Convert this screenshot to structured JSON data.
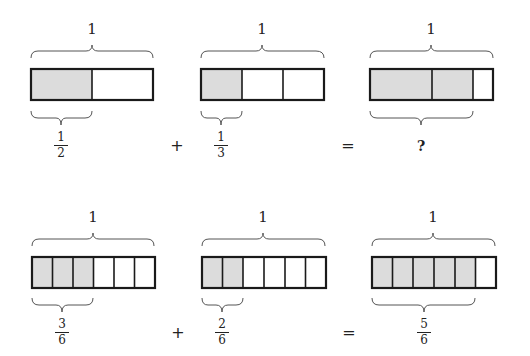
{
  "colors": {
    "fill": "#dcdcdc",
    "stroke": "#1a1a1a",
    "brace": "#555555"
  },
  "rows": [
    {
      "operator_plus": "+",
      "operator_equals": "=",
      "bars": [
        {
          "whole_label": "1",
          "parts": 2,
          "shaded": 1,
          "label": {
            "num": "1",
            "den": "2"
          }
        },
        {
          "whole_label": "1",
          "parts": 3,
          "shaded": 1,
          "label": {
            "num": "1",
            "den": "3"
          }
        },
        {
          "whole_label": "1",
          "parts": 6,
          "shaded": 5,
          "result_label": "?"
        }
      ]
    },
    {
      "operator_plus": "+",
      "operator_equals": "=",
      "bars": [
        {
          "whole_label": "1",
          "parts": 6,
          "shaded": 3,
          "label": {
            "num": "3",
            "den": "6"
          }
        },
        {
          "whole_label": "1",
          "parts": 6,
          "shaded": 2,
          "label": {
            "num": "2",
            "den": "6"
          }
        },
        {
          "whole_label": "1",
          "parts": 6,
          "shaded": 5,
          "label": {
            "num": "5",
            "den": "6"
          }
        }
      ]
    }
  ]
}
